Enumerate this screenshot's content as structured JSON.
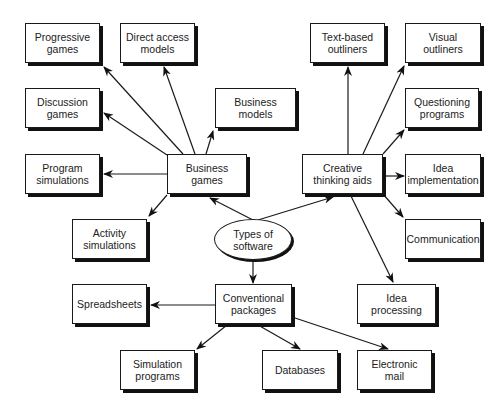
{
  "diagram": {
    "center": {
      "id": "types",
      "label": "Types of software"
    },
    "categories": [
      {
        "id": "business_games",
        "label": "Business games"
      },
      {
        "id": "creative_aids",
        "label": "Creative thinking aids"
      },
      {
        "id": "conventional",
        "label": "Conventional packages"
      }
    ],
    "nodes": {
      "progressive_games": "Progressive games",
      "direct_access_models": "Direct access models",
      "discussion_games": "Discussion games",
      "business_models": "Business models",
      "program_simulations": "Program simulations",
      "business_games": "Business games",
      "activity_simulations": "Activity simulations",
      "text_outliners": "Text-based outliners",
      "visual_outliners": "Visual outliners",
      "questioning_programs": "Questioning programs",
      "creative_aids": "Creative thinking aids",
      "idea_implementation": "Idea implementation",
      "communication": "Communication",
      "idea_processing": "Idea processing",
      "types": "Types of software",
      "spreadsheets": "Spreadsheets",
      "conventional": "Conventional packages",
      "simulation_programs": "Simulation programs",
      "databases": "Databases",
      "electronic_mail": "Electronic mail"
    },
    "edges": [
      [
        "types",
        "business_games"
      ],
      [
        "types",
        "creative_aids"
      ],
      [
        "types",
        "conventional"
      ],
      [
        "business_games",
        "progressive_games"
      ],
      [
        "business_games",
        "direct_access_models"
      ],
      [
        "business_games",
        "discussion_games"
      ],
      [
        "business_games",
        "business_models"
      ],
      [
        "business_games",
        "program_simulations"
      ],
      [
        "business_games",
        "activity_simulations"
      ],
      [
        "creative_aids",
        "text_outliners"
      ],
      [
        "creative_aids",
        "visual_outliners"
      ],
      [
        "creative_aids",
        "questioning_programs"
      ],
      [
        "creative_aids",
        "idea_implementation"
      ],
      [
        "creative_aids",
        "communication"
      ],
      [
        "creative_aids",
        "idea_processing"
      ],
      [
        "conventional",
        "spreadsheets"
      ],
      [
        "conventional",
        "simulation_programs"
      ],
      [
        "conventional",
        "databases"
      ],
      [
        "conventional",
        "electronic_mail"
      ]
    ]
  }
}
